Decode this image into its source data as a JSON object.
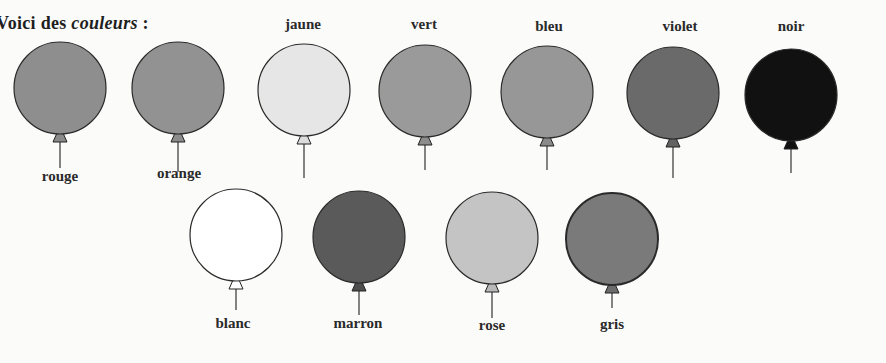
{
  "title": {
    "prefix": "Voici des",
    "emphasis": "couleurs",
    "suffix": ":"
  },
  "balloons": [
    {
      "name": "rouge",
      "fill": "#8e8e8e",
      "knot": "#8a8a8a",
      "cx": 60,
      "cy": 88,
      "r": 46,
      "label_pos": "below",
      "label_x": 60,
      "label_y": 168,
      "string_end": 168
    },
    {
      "name": "orange",
      "fill": "#929292",
      "knot": "#8c8c8c",
      "cx": 178,
      "cy": 88,
      "r": 46,
      "label_pos": "below",
      "label_x": 179,
      "label_y": 165,
      "string_end": 172
    },
    {
      "name": "jaune",
      "fill": "#e6e6e6",
      "knot": "#dcdcdc",
      "cx": 304,
      "cy": 90,
      "r": 46,
      "label_pos": "above",
      "label_x": 303,
      "label_y": 16,
      "string_end": 178
    },
    {
      "name": "vert",
      "fill": "#9a9a9a",
      "knot": "#8d8d8d",
      "cx": 425,
      "cy": 91,
      "r": 46,
      "label_pos": "above",
      "label_x": 424,
      "label_y": 16,
      "string_end": 170
    },
    {
      "name": "bleu",
      "fill": "#979797",
      "knot": "#8a8a8a",
      "cx": 547,
      "cy": 92,
      "r": 46,
      "label_pos": "above",
      "label_x": 549,
      "label_y": 18,
      "string_end": 170
    },
    {
      "name": "violet",
      "fill": "#6a6a6a",
      "knot": "#626262",
      "cx": 673,
      "cy": 93,
      "r": 46,
      "label_pos": "above",
      "label_x": 680,
      "label_y": 18,
      "string_end": 178
    },
    {
      "name": "noir",
      "fill": "#111111",
      "knot": "#111111",
      "cx": 791,
      "cy": 95,
      "r": 46,
      "label_pos": "above",
      "label_x": 791,
      "label_y": 18,
      "string_end": 173
    },
    {
      "name": "blanc",
      "fill": "#ffffff",
      "knot": "#ffffff",
      "cx": 236,
      "cy": 235,
      "r": 46,
      "label_pos": "below",
      "label_x": 233,
      "label_y": 315,
      "string_end": 310
    },
    {
      "name": "marron",
      "fill": "#5a5a5a",
      "knot": "#4e4e4e",
      "cx": 359,
      "cy": 237,
      "r": 46,
      "label_pos": "below",
      "label_x": 358,
      "label_y": 315,
      "string_end": 315
    },
    {
      "name": "rose",
      "fill": "#c4c4c4",
      "knot": "#b8b8b8",
      "cx": 492,
      "cy": 238,
      "r": 46,
      "label_pos": "below",
      "label_x": 492,
      "label_y": 317,
      "string_end": 318
    },
    {
      "name": "gris",
      "fill": "#7a7a7a",
      "knot": "#6c6c6c",
      "cx": 612,
      "cy": 239,
      "r": 46,
      "label_pos": "below",
      "label_x": 612,
      "label_y": 316,
      "string_end": 308
    }
  ]
}
